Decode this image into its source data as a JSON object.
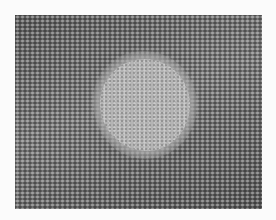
{
  "image": {
    "description": "Grayscale high-resolution electron micrograph showing a periodic atomic lattice with a bright, roughly circular amorphous region near the center",
    "colormap": "grayscale",
    "border_color": "#fbfbfb",
    "lattice_tone": "#6e6e6e",
    "feature_tone": "#b4b4b4"
  }
}
